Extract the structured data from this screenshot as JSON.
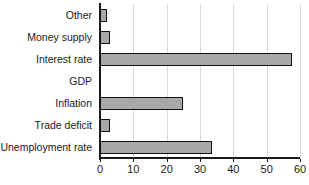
{
  "chart_data": {
    "type": "bar",
    "orientation": "horizontal",
    "title": "",
    "subtitle": "",
    "xlabel": "",
    "ylabel": "",
    "categories": [
      "Other",
      "Money supply",
      "Interest rate",
      "GDP",
      "Inflation",
      "Trade deficit",
      "Unemployment rate"
    ],
    "values": [
      2,
      3,
      57.5,
      0,
      25,
      3,
      33.5
    ],
    "xlim": [
      0,
      60
    ],
    "xticks": [
      0,
      10,
      20,
      30,
      40,
      50,
      60
    ],
    "xtick_labels": [
      "0",
      "10",
      "20",
      "30",
      "40",
      "50",
      "60"
    ],
    "grid": "vertical",
    "legend": "none",
    "bar_fill_color": "#a8a8a8",
    "bar_border_color": "#111111",
    "gridline_color": "#d8d8d8",
    "axis_color": "#1a1a1a",
    "background_color": "#ffffff"
  }
}
